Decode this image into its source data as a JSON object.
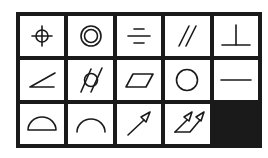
{
  "grid": {
    "columns": 5,
    "rows": 3
  },
  "symbols": [
    {
      "name": "position",
      "label": "Position"
    },
    {
      "name": "concentricity",
      "label": "Concentricity"
    },
    {
      "name": "symmetry",
      "label": "Symmetry"
    },
    {
      "name": "parallelism",
      "label": "Parallelism"
    },
    {
      "name": "perpendicularity",
      "label": "Perpendicularity"
    },
    {
      "name": "angularity",
      "label": "Angularity"
    },
    {
      "name": "cylindricity",
      "label": "Cylindricity"
    },
    {
      "name": "flatness",
      "label": "Flatness"
    },
    {
      "name": "circularity",
      "label": "Circularity"
    },
    {
      "name": "straightness",
      "label": "Straightness"
    },
    {
      "name": "profile-of-surface",
      "label": "Profile of a surface"
    },
    {
      "name": "profile-of-line",
      "label": "Profile of a line"
    },
    {
      "name": "circular-runout",
      "label": "Circular runout"
    },
    {
      "name": "total-runout",
      "label": "Total runout"
    },
    {
      "name": "empty",
      "label": ""
    }
  ],
  "colors": {
    "line": "#1a1a1a",
    "cell": "#ffffff",
    "filled_cell": "#1a1a1a"
  }
}
